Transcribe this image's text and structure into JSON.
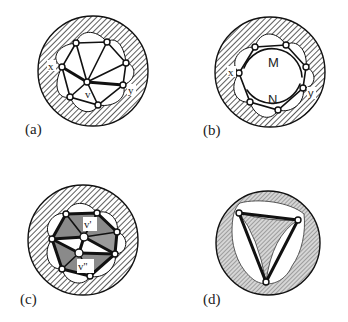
{
  "figure": {
    "colors": {
      "hatch_line": "#333333",
      "background": "#ffffff",
      "edge": "#111111",
      "shaded_face": "#8a8a8a",
      "light_face": "#bdbdbd"
    },
    "panels": [
      {
        "id": "a",
        "label": "(a)",
        "vertex_labels": {
          "x": "x",
          "y": "y",
          "v": "v"
        }
      },
      {
        "id": "b",
        "label": "(b)",
        "vertex_labels": {
          "x": "x",
          "y": "y"
        },
        "region_labels": {
          "M": "M",
          "N": "N"
        }
      },
      {
        "id": "c",
        "label": "(c)",
        "vertex_labels": {
          "v1": "v'",
          "v2": "v''"
        }
      },
      {
        "id": "d",
        "label": "(d)"
      }
    ]
  }
}
